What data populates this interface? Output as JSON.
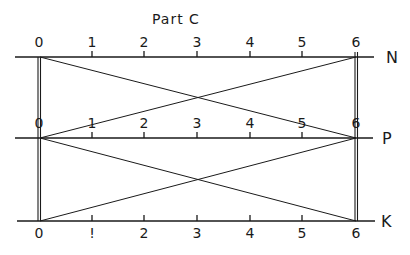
{
  "title": "Part C",
  "colors": {
    "ink": "#1a1a1a",
    "background": "#ffffff"
  },
  "scales": [
    {
      "name": "N",
      "label": "N",
      "tick_labels": [
        "0",
        "1",
        "2",
        "3",
        "4",
        "5",
        "6"
      ]
    },
    {
      "name": "P",
      "label": "P",
      "tick_labels": [
        "0",
        "1",
        "2",
        "3",
        "4",
        "5",
        "6"
      ]
    },
    {
      "name": "K",
      "label": "K",
      "tick_labels": [
        "0",
        "!",
        "2",
        "3",
        "4",
        "5",
        "6"
      ]
    }
  ],
  "connections": [
    {
      "from": "N:0",
      "to": "P:6"
    },
    {
      "from": "P:0",
      "to": "N:6"
    },
    {
      "from": "P:0",
      "to": "K:6"
    },
    {
      "from": "K:0",
      "to": "P:6"
    }
  ],
  "verticals": [
    {
      "at": "0",
      "from": "N",
      "to": "K"
    },
    {
      "at": "6",
      "from": "N",
      "to": "K"
    }
  ]
}
